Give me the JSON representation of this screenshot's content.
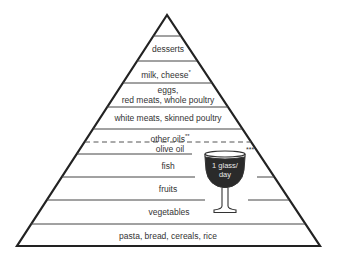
{
  "diagram": {
    "type": "food-pyramid",
    "colors": {
      "outline": "#222222",
      "divider": "#444444",
      "wine_fill": "#2a2a2a",
      "background": "#ffffff"
    },
    "tiers": [
      {
        "label": "desserts",
        "note": ""
      },
      {
        "label": "milk,  cheese",
        "note": "*"
      },
      {
        "label_line1": "eggs,",
        "label_line2": "red meats, whole poultry"
      },
      {
        "label": "white meats, skinned poultry"
      },
      {
        "label": "other oils",
        "note": "**"
      },
      {
        "label": "olive oil"
      },
      {
        "label": "fish"
      },
      {
        "label": "fruits"
      },
      {
        "label": "vegetables"
      },
      {
        "label": "pasta, bread, cereals, rice"
      }
    ],
    "wine": {
      "line1": "1 glass/",
      "line2": "day",
      "note": "***"
    }
  }
}
